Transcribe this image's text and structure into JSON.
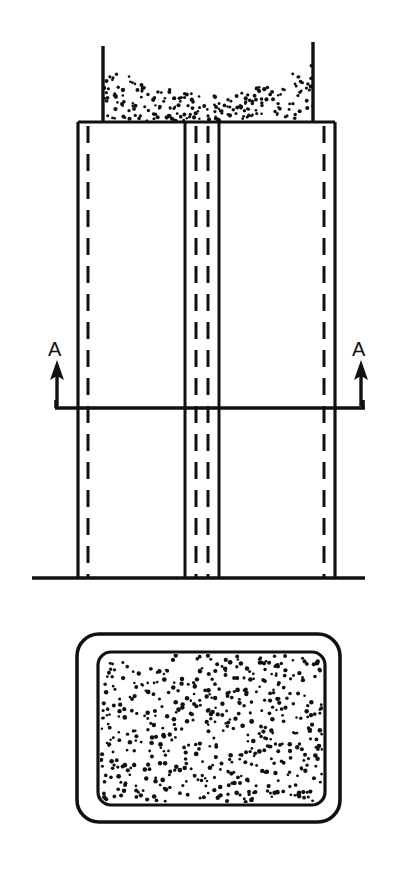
{
  "document": {
    "kind": "technical-line-drawing",
    "background_color": "#ffffff",
    "ink_color": "#111111",
    "width": 397,
    "height": 872
  },
  "figures": [
    {
      "id": "elevation-view",
      "name": "Elevation view of silo with central divider",
      "description": "Vertical sectioned elevation of a rectangular silo filled with granular material, showing a central double-wall divider column, hidden edges as dashed lines, a ground line and a section cut line A-A.",
      "components": {
        "hopper_fill_label": "granular material",
        "left_hopper_wall": {
          "x": 103,
          "y_top": 46,
          "y_bottom": 122
        },
        "right_hopper_wall": {
          "x": 313,
          "y_top": 42,
          "y_bottom": 122
        },
        "top_plate": {
          "x_left": 78,
          "x_right": 335,
          "y": 122
        },
        "body": {
          "x_left": 78,
          "x_right": 335,
          "y_top": 122,
          "y_bottom": 578
        },
        "ground_line": {
          "x_left": 32,
          "x_right": 365,
          "y": 578
        },
        "outer_hidden_edges": [
          88,
          324
        ],
        "center_column": {
          "solid_edges": [
            185,
            219
          ],
          "hidden_edges": [
            196,
            208
          ]
        }
      }
    },
    {
      "id": "section-view",
      "name": "Section A-A plan view",
      "description": "Plan section showing a rounded rectangular outer wall and an inner rounded rectangular chamber filled with densely stippled granular material.",
      "components": {
        "outer_rect": {
          "x": 77,
          "y": 634,
          "width": 263,
          "height": 188,
          "radius": 20
        },
        "inner_rect": {
          "x": 98,
          "y": 652,
          "width": 227,
          "height": 153,
          "radius": 12
        },
        "fill_label": "granular material"
      }
    }
  ],
  "annotations": {
    "section_line": {
      "name": "section-cut-line-A-A",
      "y": 408,
      "x_left": 55,
      "x_right": 365,
      "tick_height": 8
    },
    "markers": [
      {
        "id": "section-marker-left",
        "label": "A",
        "label_x": 48,
        "label_y": 356,
        "arrow_x": 57,
        "arrow_tip_y": 362,
        "arrow_base_y": 408,
        "direction": "up"
      },
      {
        "id": "section-marker-right",
        "label": "A",
        "label_x": 352,
        "label_y": 356,
        "arrow_x": 361,
        "arrow_tip_y": 362,
        "arrow_base_y": 408,
        "direction": "up"
      }
    ]
  },
  "stipple": {
    "hopper": {
      "region": {
        "x": 104,
        "y": 60,
        "width": 209,
        "height": 62
      },
      "dot_radius": 1.7,
      "count": 210,
      "seed": 20240611,
      "profile": "concave-top"
    },
    "section": {
      "region": {
        "x": 101,
        "y": 655,
        "width": 221,
        "height": 147
      },
      "dot_radius": 1.9,
      "count": 520,
      "seed": 777001,
      "profile": "uniform"
    }
  }
}
